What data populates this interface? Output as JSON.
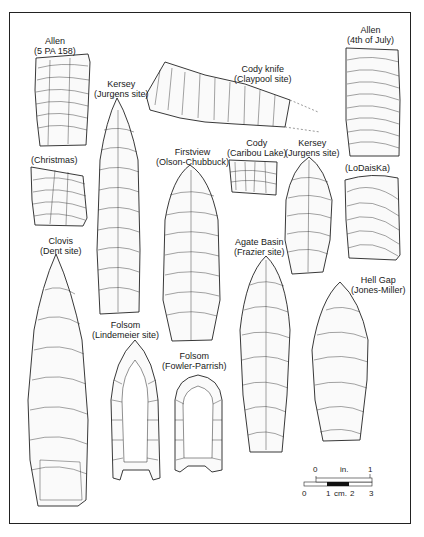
{
  "figure": {
    "artifacts": [
      {
        "id": "allen-5pa158",
        "type": "Allen",
        "site": "(5 PA 158)"
      },
      {
        "id": "kersey-jurgens-1",
        "type": "Kersey",
        "site": "(Jurgens site)"
      },
      {
        "id": "cody-knife",
        "type": "Cody knife",
        "site": "(Claypool site)"
      },
      {
        "id": "allen-4th-of-july",
        "type": "Allen",
        "site": "(4th of July)"
      },
      {
        "id": "christmas",
        "type": "",
        "site": "(Christmas)"
      },
      {
        "id": "firstview",
        "type": "Firstview",
        "site": "(Olson-Chubbuck)"
      },
      {
        "id": "cody-caribou",
        "type": "Cody",
        "site": "(Caribou Lake)"
      },
      {
        "id": "kersey-jurgens-2",
        "type": "Kersey",
        "site": "(Jurgens site)"
      },
      {
        "id": "lodaiska",
        "type": "",
        "site": "(LoDaisKa)"
      },
      {
        "id": "clovis",
        "type": "Clovis",
        "site": "(Dent site)"
      },
      {
        "id": "agate-basin",
        "type": "Agate Basin",
        "site": "(Frazier site)"
      },
      {
        "id": "hell-gap",
        "type": "Hell Gap",
        "site": "(Jones-Miller)"
      },
      {
        "id": "folsom-lindenmeier",
        "type": "Folsom",
        "site": "(Lindemeier site)"
      },
      {
        "id": "folsom-fowler",
        "type": "Folsom",
        "site": "(Fowler-Parrish)"
      }
    ],
    "scale_bar": {
      "inch_label": "in.",
      "inch_ticks": [
        "0",
        "1"
      ],
      "cm_label": "cm.",
      "cm_ticks": [
        "0",
        "1",
        "2",
        "3"
      ]
    }
  }
}
